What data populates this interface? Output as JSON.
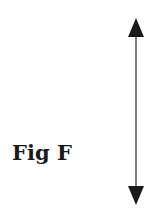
{
  "figure": {
    "label": "Fig F",
    "arrow": {
      "type": "double-headed-vertical",
      "x": 136,
      "y_top": 18,
      "y_bottom": 205,
      "head_length": 19,
      "head_half_width": 8,
      "color": "#1a1a1a",
      "shaft_color": "#555555"
    }
  }
}
